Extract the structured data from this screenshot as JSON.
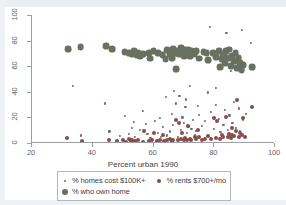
{
  "chart_data": {
    "type": "scatter",
    "title": "",
    "xlabel": "Percent urban 1990",
    "ylabel": "",
    "xlim": [
      20,
      100
    ],
    "ylim": [
      0,
      100
    ],
    "xticks": [
      20,
      40,
      60,
      80,
      100
    ],
    "yticks": [
      0,
      20,
      40,
      60,
      80,
      100
    ],
    "grid": false,
    "legend_position": "below-axis",
    "series": [
      {
        "name": "% homes cost $100K+",
        "marker": "small-dot",
        "color": "#6b6f62",
        "radius": 1.1,
        "points": [
          [
            33.5,
            44.5
          ],
          [
            36.0,
            6.0
          ],
          [
            44.0,
            31.0
          ],
          [
            45.5,
            9.0
          ],
          [
            49.0,
            5.5
          ],
          [
            50.5,
            21.0
          ],
          [
            52.0,
            7.0
          ],
          [
            53.0,
            12.0
          ],
          [
            54.0,
            5.0
          ],
          [
            55.5,
            10.0
          ],
          [
            56.5,
            25.0
          ],
          [
            58.0,
            7.0
          ],
          [
            59.0,
            4.0
          ],
          [
            60.5,
            17.5
          ],
          [
            61.5,
            8.0
          ],
          [
            62.5,
            5.0
          ],
          [
            63.0,
            12.5
          ],
          [
            64.5,
            6.0
          ],
          [
            65.5,
            9.0
          ],
          [
            66.0,
            23.0
          ],
          [
            66.5,
            14.0
          ],
          [
            67.5,
            31.0
          ],
          [
            68.0,
            5.0
          ],
          [
            68.5,
            37.0
          ],
          [
            69.0,
            10.5
          ],
          [
            69.5,
            20.0
          ],
          [
            70.0,
            16.0
          ],
          [
            70.5,
            28.5
          ],
          [
            71.0,
            8.0
          ],
          [
            71.5,
            13.0
          ],
          [
            72.0,
            44.5
          ],
          [
            72.5,
            11.0
          ],
          [
            73.0,
            18.0
          ],
          [
            73.5,
            6.0
          ],
          [
            74.0,
            9.5
          ],
          [
            75.0,
            22.0
          ],
          [
            76.0,
            13.5
          ],
          [
            77.0,
            17.0
          ],
          [
            78.0,
            39.5
          ],
          [
            78.5,
            91.0
          ],
          [
            79.0,
            24.0
          ],
          [
            80.0,
            11.0
          ],
          [
            80.5,
            30.0
          ],
          [
            81.5,
            19.0
          ],
          [
            82.0,
            8.5
          ],
          [
            83.0,
            14.0
          ],
          [
            83.5,
            26.0
          ],
          [
            84.0,
            86.0
          ],
          [
            84.5,
            10.0
          ],
          [
            85.0,
            21.5
          ],
          [
            85.5,
            56.5
          ],
          [
            86.0,
            16.0
          ],
          [
            86.5,
            32.0
          ],
          [
            87.0,
            12.0
          ],
          [
            88.0,
            27.0
          ],
          [
            88.5,
            9.0
          ],
          [
            89.0,
            88.5
          ],
          [
            89.5,
            18.0
          ],
          [
            90.5,
            23.0
          ],
          [
            92.0,
            78.0
          ],
          [
            64.0,
            36.0
          ],
          [
            66.8,
            41.0
          ],
          [
            70.8,
            34.0
          ],
          [
            74.5,
            29.0
          ],
          [
            57.5,
            15.0
          ],
          [
            62.0,
            19.5
          ],
          [
            53.5,
            16.5
          ],
          [
            80.5,
            43.0
          ]
        ]
      },
      {
        "name": "% rents $700+/mo",
        "marker": "medium-dot",
        "color": "#8a4b4b",
        "radius": 2.0,
        "points": [
          [
            31.5,
            4.0
          ],
          [
            36.5,
            1.5
          ],
          [
            45.5,
            2.0
          ],
          [
            48.0,
            1.5
          ],
          [
            50.0,
            2.0
          ],
          [
            51.0,
            1.0
          ],
          [
            52.0,
            3.5
          ],
          [
            52.5,
            1.5
          ],
          [
            53.0,
            2.5
          ],
          [
            54.0,
            1.5
          ],
          [
            55.0,
            2.0
          ],
          [
            56.5,
            1.0
          ],
          [
            58.5,
            1.5
          ],
          [
            59.5,
            2.0
          ],
          [
            61.0,
            1.5
          ],
          [
            62.0,
            2.5
          ],
          [
            63.5,
            1.5
          ],
          [
            64.5,
            2.0
          ],
          [
            65.5,
            3.0
          ],
          [
            66.0,
            1.5
          ],
          [
            66.5,
            2.5
          ],
          [
            67.5,
            18.0
          ],
          [
            68.0,
            2.0
          ],
          [
            68.5,
            15.5
          ],
          [
            69.0,
            3.0
          ],
          [
            69.5,
            8.0
          ],
          [
            70.0,
            2.0
          ],
          [
            70.5,
            4.0
          ],
          [
            71.0,
            2.5
          ],
          [
            72.0,
            3.5
          ],
          [
            72.5,
            2.0
          ],
          [
            73.5,
            5.0
          ],
          [
            74.0,
            3.0
          ],
          [
            75.0,
            4.5
          ],
          [
            76.0,
            2.5
          ],
          [
            77.0,
            3.0
          ],
          [
            78.0,
            5.5
          ],
          [
            79.0,
            3.5
          ],
          [
            80.0,
            19.5
          ],
          [
            80.5,
            4.0
          ],
          [
            81.0,
            17.5
          ],
          [
            82.0,
            3.0
          ],
          [
            82.5,
            6.0
          ],
          [
            83.0,
            4.5
          ],
          [
            84.0,
            20.0
          ],
          [
            84.5,
            5.0
          ],
          [
            85.0,
            7.0
          ],
          [
            85.5,
            4.0
          ],
          [
            86.0,
            6.5
          ],
          [
            86.5,
            5.5
          ],
          [
            87.0,
            9.0
          ],
          [
            87.5,
            33.5
          ],
          [
            88.0,
            4.5
          ],
          [
            88.5,
            7.5
          ],
          [
            89.0,
            6.0
          ],
          [
            89.5,
            19.5
          ],
          [
            90.0,
            5.0
          ],
          [
            92.5,
            28.0
          ],
          [
            57.0,
            9.5
          ],
          [
            60.0,
            7.5
          ],
          [
            63.0,
            6.5
          ],
          [
            71.5,
            13.0
          ],
          [
            74.5,
            10.5
          ],
          [
            85.8,
            11.5
          ]
        ]
      },
      {
        "name": "% who own home",
        "marker": "large-dot",
        "color": "#6a7060",
        "radius": 3.4,
        "points": [
          [
            32.0,
            73.5
          ],
          [
            36.0,
            75.0
          ],
          [
            44.5,
            76.0
          ],
          [
            46.5,
            73.5
          ],
          [
            50.5,
            71.0
          ],
          [
            52.0,
            70.0
          ],
          [
            53.0,
            69.0
          ],
          [
            53.5,
            71.5
          ],
          [
            54.5,
            68.5
          ],
          [
            55.0,
            70.5
          ],
          [
            55.5,
            67.5
          ],
          [
            56.5,
            69.5
          ],
          [
            58.5,
            70.0
          ],
          [
            60.0,
            72.0
          ],
          [
            61.5,
            70.5
          ],
          [
            63.0,
            68.5
          ],
          [
            64.5,
            72.5
          ],
          [
            65.5,
            69.5
          ],
          [
            66.5,
            73.5
          ],
          [
            67.0,
            70.0
          ],
          [
            67.5,
            58.0
          ],
          [
            68.0,
            71.5
          ],
          [
            68.5,
            69.0
          ],
          [
            69.0,
            74.5
          ],
          [
            69.5,
            71.0
          ],
          [
            70.0,
            67.5
          ],
          [
            70.5,
            72.5
          ],
          [
            71.0,
            70.0
          ],
          [
            71.5,
            73.0
          ],
          [
            72.0,
            68.0
          ],
          [
            72.5,
            71.5
          ],
          [
            73.5,
            69.5
          ],
          [
            75.0,
            66.0
          ],
          [
            76.5,
            71.0
          ],
          [
            78.0,
            64.5
          ],
          [
            79.5,
            70.5
          ],
          [
            80.5,
            67.0
          ],
          [
            81.5,
            72.0
          ],
          [
            82.5,
            65.5
          ],
          [
            83.0,
            69.0
          ],
          [
            83.5,
            62.0
          ],
          [
            84.0,
            71.5
          ],
          [
            84.5,
            66.5
          ],
          [
            85.0,
            73.0
          ],
          [
            85.5,
            60.0
          ],
          [
            86.0,
            68.0
          ],
          [
            86.5,
            64.0
          ],
          [
            87.0,
            70.0
          ],
          [
            87.5,
            58.5
          ],
          [
            88.0,
            66.5
          ],
          [
            88.5,
            62.5
          ],
          [
            89.0,
            57.0
          ],
          [
            89.5,
            61.0
          ],
          [
            92.5,
            59.0
          ],
          [
            64.0,
            65.5
          ],
          [
            66.0,
            66.5
          ],
          [
            59.0,
            66.0
          ],
          [
            74.0,
            72.0
          ],
          [
            77.5,
            70.0
          ],
          [
            82.0,
            59.5
          ]
        ]
      }
    ]
  },
  "legend": {
    "entries": [
      {
        "label": "% homes cost $100K+",
        "color": "#6b6f62",
        "size": 2
      },
      {
        "label": "% rents $700+/mo",
        "color": "#8a4b4b",
        "size": 4
      },
      {
        "label": "% who own home",
        "color": "#6a7060",
        "size": 6
      }
    ]
  },
  "colors": {
    "axis": "#9aa0a6",
    "text": "#3c4043",
    "tick_text": "#5f6368",
    "background": "#ffffff"
  }
}
